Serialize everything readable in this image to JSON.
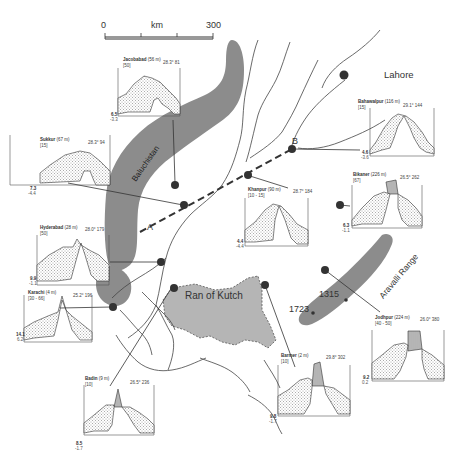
{
  "scale_bar": {
    "start": "0",
    "unit": "km",
    "end": "300"
  },
  "places": {
    "lahore": "Lahore",
    "balochistan": "Baluchistan",
    "ran_of_kutch": "Ran of Kutch",
    "aravalli": "Aravalli Range",
    "transect_a": "A",
    "transect_b": "B",
    "elev_1723": "1723",
    "elev_1315": "1315"
  },
  "stations": [
    {
      "id": "jacobabad",
      "name": "Jacobabad",
      "alt": "(56 m)",
      "sub": "[50]",
      "coord": "28.3° 81",
      "ymax": "6.5",
      "ymin": "-3.3"
    },
    {
      "id": "bahawalpur",
      "name": "Bahawalpur",
      "alt": "(116 m)",
      "sub": "[15]",
      "coord": "29.1° 144",
      "ymax": "4.6",
      "ymin": "-3.6"
    },
    {
      "id": "sukkur",
      "name": "Sukkur",
      "alt": "(67 m)",
      "sub": "[15]",
      "coord": "28.3° 94",
      "ymax": "7.3",
      "ymin": "-4.4"
    },
    {
      "id": "khanpur",
      "name": "Khanpur",
      "alt": "(90 m)",
      "sub": "[10 - 15]",
      "coord": "28.7° 184",
      "ymax": "4.4",
      "ymin": "-4.4"
    },
    {
      "id": "bikaner",
      "name": "Bikaner",
      "alt": "(226 m)",
      "sub": "[67]",
      "coord": "26.5° 262",
      "ymax": "6.3",
      "ymin": "-1.1"
    },
    {
      "id": "hyderabad",
      "name": "Hyderabad",
      "alt": "(28 m)",
      "sub": "[50]",
      "coord": "28.0° 179",
      "ymax": "9.9",
      "ymin": "-1.1"
    },
    {
      "id": "karachi",
      "name": "Karachi",
      "alt": "(4 m)",
      "sub": "[30 - 66]",
      "coord": "25.2° 196",
      "ymax": "14.1",
      "ymin": "6.2"
    },
    {
      "id": "badin",
      "name": "Badin",
      "alt": "(9 m)",
      "sub": "[10]",
      "coord": "26.5° 236",
      "ymax": "8.5",
      "ymin": "-1.7"
    },
    {
      "id": "barmer",
      "name": "Barmer",
      "alt": "(2 m)",
      "sub": "[10]",
      "coord": "29.8° 302",
      "ymax": "9.8",
      "ymin": "-1.7"
    },
    {
      "id": "jodhpur",
      "name": "Jodhpur",
      "alt": "(224 m)",
      "sub": "[40 - 50]",
      "coord": "26.0° 380",
      "ymax": "9.2",
      "ymin": "0.2"
    }
  ],
  "colors": {
    "land_shade": "#8c8c8c",
    "ran_fill": "#b5b5b5",
    "line": "#333333",
    "dot": "#333333",
    "stipple": "#555555"
  }
}
